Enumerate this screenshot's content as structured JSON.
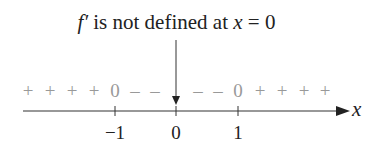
{
  "diagram": {
    "annotation": {
      "func": "f′",
      "text": " is not defined at ",
      "var": "x",
      "eq": " = 0"
    },
    "axis_label": "x",
    "ticks": [
      {
        "label": "−1",
        "x": 115
      },
      {
        "label": "0",
        "x": 176
      },
      {
        "label": "1",
        "x": 238
      }
    ],
    "signs": [
      {
        "s": "+",
        "x": 28
      },
      {
        "s": "+",
        "x": 50
      },
      {
        "s": "+",
        "x": 72
      },
      {
        "s": "+",
        "x": 94
      },
      {
        "s": "0",
        "x": 115
      },
      {
        "s": "–",
        "x": 135
      },
      {
        "s": "–",
        "x": 155
      },
      {
        "s": "–",
        "x": 198
      },
      {
        "s": "–",
        "x": 218
      },
      {
        "s": "0",
        "x": 238
      },
      {
        "s": "+",
        "x": 260
      },
      {
        "s": "+",
        "x": 282
      },
      {
        "s": "+",
        "x": 304
      },
      {
        "s": "+",
        "x": 325
      }
    ]
  }
}
